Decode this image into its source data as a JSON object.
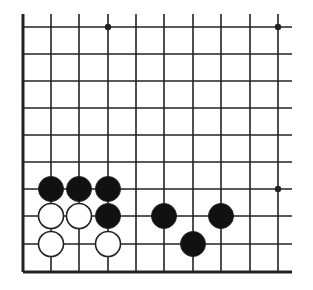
{
  "diagram": {
    "type": "go-board-fragment",
    "corner": "bottom-left",
    "colors": {
      "background": "#ffffff",
      "line": "#222222",
      "black_stone": "#111111",
      "white_stone": "#ffffff",
      "stone_outline": "#222222"
    },
    "grid": {
      "columns_x": [
        23,
        51,
        79,
        108,
        136,
        164,
        193,
        221,
        250,
        278
      ],
      "rows_y": [
        27,
        54,
        81,
        108,
        135,
        162,
        189,
        216,
        244,
        272
      ],
      "extend_right_to": 292,
      "extend_top_to": 14,
      "edge_left": true,
      "edge_bottom": true
    },
    "star_points": [
      {
        "col": 3,
        "row": 0
      },
      {
        "col": 9,
        "row": 0
      },
      {
        "col": 9,
        "row": 6
      }
    ],
    "stones": [
      {
        "color": "black",
        "col": 1,
        "row": 6
      },
      {
        "color": "black",
        "col": 2,
        "row": 6
      },
      {
        "color": "black",
        "col": 3,
        "row": 6
      },
      {
        "color": "white",
        "col": 1,
        "row": 7
      },
      {
        "color": "white",
        "col": 2,
        "row": 7
      },
      {
        "color": "black",
        "col": 3,
        "row": 7
      },
      {
        "color": "black",
        "col": 5,
        "row": 7
      },
      {
        "color": "black",
        "col": 7,
        "row": 7
      },
      {
        "color": "white",
        "col": 1,
        "row": 8
      },
      {
        "color": "white",
        "col": 3,
        "row": 8
      },
      {
        "color": "black",
        "col": 6,
        "row": 8
      }
    ]
  }
}
